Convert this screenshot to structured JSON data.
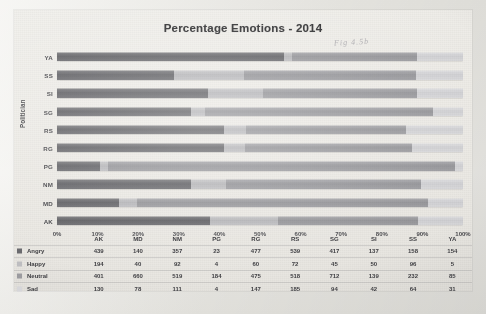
{
  "chart_data": {
    "type": "bar",
    "subtype": "stacked-bar-100-horizontal",
    "title": "Percentage Emotions - 2014",
    "xlabel": "",
    "ylabel": "Politician",
    "orientation": "horizontal",
    "stacked": true,
    "normalized": true,
    "grid": false,
    "legend_position": "bottom-table",
    "xlim": [
      0,
      100
    ],
    "xticks": [
      "0%",
      "10%",
      "20%",
      "30%",
      "40%",
      "50%",
      "60%",
      "70%",
      "80%",
      "90%",
      "100%"
    ],
    "categories": [
      "AK",
      "MD",
      "NM",
      "PG",
      "RG",
      "RS",
      "SG",
      "SI",
      "SS",
      "YA"
    ],
    "category_order_top_to_bottom": [
      "YA",
      "SS",
      "SI",
      "SG",
      "RS",
      "RG",
      "PG",
      "NM",
      "MD",
      "AK"
    ],
    "series": [
      {
        "name": "Angry",
        "color": "#6a6a6e",
        "values": [
          439,
          140,
          357,
          23,
          477,
          539,
          417,
          137,
          158,
          154
        ]
      },
      {
        "name": "Happy",
        "color": "#bdbdc0",
        "values": [
          194,
          40,
          92,
          4,
          60,
          72,
          45,
          50,
          96,
          5
        ]
      },
      {
        "name": "Neutral",
        "color": "#9b9b9f",
        "values": [
          401,
          660,
          519,
          184,
          475,
          518,
          712,
          139,
          232,
          85
        ]
      },
      {
        "name": "Sad",
        "color": "#d6d6d9",
        "values": [
          130,
          78,
          111,
          4,
          147,
          185,
          94,
          42,
          64,
          31
        ]
      }
    ]
  },
  "chart": {
    "title": "Percentage Emotions - 2014",
    "y_axis_title": "Politician",
    "handwritten_note": "Fig 4.5b"
  },
  "table": {
    "corner_label": "",
    "column_headers": [
      "AK",
      "MD",
      "NM",
      "PG",
      "RG",
      "RS",
      "SG",
      "SI",
      "SS",
      "YA"
    ],
    "rows": [
      {
        "label": "Angry",
        "key": "angry",
        "values": [
          "439",
          "140",
          "357",
          "23",
          "477",
          "539",
          "417",
          "137",
          "158",
          "154"
        ]
      },
      {
        "label": "Happy",
        "key": "happy",
        "values": [
          "194",
          "40",
          "92",
          "4",
          "60",
          "72",
          "45",
          "50",
          "96",
          "5"
        ]
      },
      {
        "label": "Neutral",
        "key": "neutral",
        "values": [
          "401",
          "660",
          "519",
          "184",
          "475",
          "518",
          "712",
          "139",
          "232",
          "85"
        ]
      },
      {
        "label": "Sad",
        "key": "sad",
        "values": [
          "130",
          "78",
          "111",
          "4",
          "147",
          "185",
          "94",
          "42",
          "64",
          "31"
        ]
      }
    ]
  }
}
